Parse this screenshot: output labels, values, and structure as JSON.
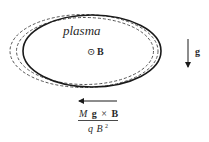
{
  "diagram": {
    "plasma_label": "plasma",
    "field_symbol": "⊙",
    "field_label": "B",
    "gravity_label": "g",
    "drift": {
      "numerator_M": "M",
      "numerator_g": "g",
      "numerator_cross": "×",
      "numerator_B": "B",
      "denominator_q": "q",
      "denominator_B": "B",
      "denominator_exp": "2"
    },
    "colors": {
      "stroke": "#1a1a1a",
      "dashed": "#555555",
      "text": "#2a2a2a"
    }
  }
}
